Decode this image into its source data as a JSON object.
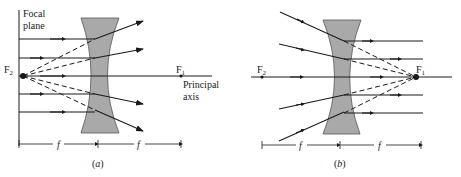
{
  "figure": {
    "panel_a": {
      "caption": "(a)",
      "labels": {
        "focal_plane_line1": "Focal",
        "focal_plane_line2": "plane",
        "f2": "F",
        "f2_sub": "2",
        "f1": "F",
        "f1_sub": "1",
        "principal_axis_line1": "Principal",
        "principal_axis_line2": "axis",
        "f_left": "f",
        "f_right": "f"
      }
    },
    "panel_b": {
      "caption": "(b)",
      "labels": {
        "f2": "F",
        "f2_sub": "2",
        "f1": "F",
        "f1_sub": "1",
        "f_left": "f",
        "f_right": "f"
      }
    },
    "colors": {
      "ink": "#1a1a1a",
      "lens_fill": "#a9a9a9",
      "lens_stroke": "#555555"
    }
  }
}
